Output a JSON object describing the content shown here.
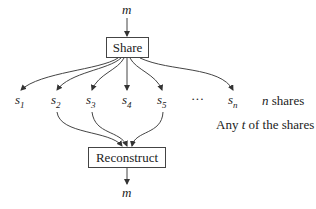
{
  "diagram": {
    "input_label": "m",
    "share_box": "Share",
    "shares": [
      {
        "base": "s",
        "sub": "1"
      },
      {
        "base": "s",
        "sub": "2"
      },
      {
        "base": "s",
        "sub": "3"
      },
      {
        "base": "s",
        "sub": "4"
      },
      {
        "base": "s",
        "sub": "5"
      },
      {
        "base": "s",
        "sub": "n"
      }
    ],
    "ellipsis": "···",
    "n_shares_var": "n",
    "n_shares_text": " shares",
    "any_prefix": "Any ",
    "any_var": "t",
    "any_suffix": " of the shares",
    "reconstruct_box": "Reconstruct",
    "output_label": "m"
  }
}
